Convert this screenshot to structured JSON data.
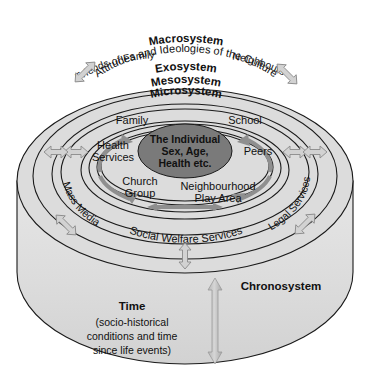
{
  "figure": {
    "type": "concentric-ring-diagram"
  },
  "colors": {
    "outline": "#1a1a1a",
    "macro_band": "#d6d6d6",
    "cylinder_face": "#dcdcdc",
    "cylinder_side": "#e3e3e3",
    "exo_band": "#ffffff",
    "meso_band": "#b8b8b8",
    "micro_band": "#ffffff",
    "individual_fill": "#7a7a7a",
    "flow_arrow": "#8f8f8f",
    "cross_arrow": "#cfcfcf",
    "text": "#111111"
  },
  "rings": {
    "macrosystem": {
      "name": "Macrosystem",
      "subtitle": "Attitudes and Ideologies of the Culture"
    },
    "exosystem": {
      "name": "Exosystem",
      "members": [
        "Friends of Family",
        "Neighbours",
        "Mass Media",
        "Legal Services",
        "Social Welfare Services"
      ]
    },
    "mesosystem": {
      "name": "Mesosystem"
    },
    "microsystem": {
      "name": "Microsystem",
      "members": [
        "Family",
        "School",
        "Health Services",
        "Peers",
        "Church Group",
        "Neighbourhood Play Area"
      ]
    },
    "chronosystem": {
      "name": "Chronosystem",
      "time_label": "Time",
      "time_detail_line1": "(socio-historical",
      "time_detail_line2": "conditions and time",
      "time_detail_line3": "since life events)"
    }
  },
  "center": {
    "line1": "The Individual",
    "line2": "Sex, Age,",
    "line3": "Health etc."
  },
  "micro_labels": {
    "family": "Family",
    "school": "School",
    "health_services_line1": "Health",
    "health_services_line2": "Services",
    "peers": "Peers",
    "church_line1": "Church",
    "church_line2": "Group",
    "play_area_line1": "Neighbourhood",
    "play_area_line2": "Play Area"
  },
  "exo_labels": {
    "friends_of_family": "Friends of Family",
    "neighbours": "Neighbours",
    "mass_media": "Mass Media",
    "legal_services": "Legal Services",
    "social_welfare": "Social Welfare Services"
  },
  "chrono_labels": {
    "name": "Chronosystem",
    "time": "Time",
    "detail1": "(socio-historical",
    "detail2": "conditions and time",
    "detail3": "since life events)"
  },
  "caption": {
    "ghost_text": ""
  },
  "icons": {
    "bidirectional_arrow": "double-headed-arrow",
    "circular_flow_arrow": "curved-flow-arrow",
    "time_arrow": "vertical-double-arrow"
  }
}
